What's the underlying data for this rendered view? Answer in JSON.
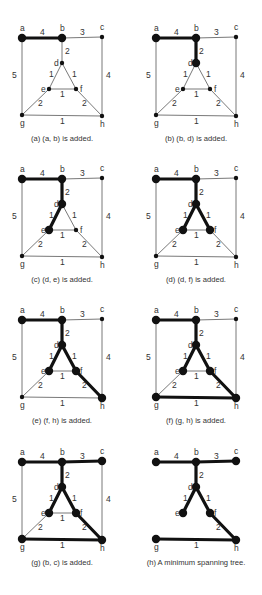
{
  "graph": {
    "nodes": {
      "a": [
        0,
        0
      ],
      "b": [
        40,
        0
      ],
      "c": [
        80,
        -1
      ],
      "d": [
        40,
        25
      ],
      "e": [
        27,
        51
      ],
      "f": [
        54,
        51
      ],
      "g": [
        0,
        77
      ],
      "h": [
        80,
        78
      ]
    },
    "node_label_offsets": {
      "a": [
        -2,
        -7
      ],
      "b": [
        -2,
        -7
      ],
      "c": [
        -2,
        -7
      ],
      "d": [
        -8,
        3
      ],
      "e": [
        -8,
        3
      ],
      "f": [
        4,
        3
      ],
      "g": [
        -2,
        11
      ],
      "h": [
        -2,
        11
      ]
    },
    "edges": [
      {
        "u": "a",
        "v": "b",
        "w": "4",
        "lx": 18,
        "ly": -3
      },
      {
        "u": "b",
        "v": "c",
        "w": "3",
        "lx": 58,
        "ly": -3
      },
      {
        "u": "b",
        "v": "d",
        "w": "2",
        "lx": 43,
        "ly": 16
      },
      {
        "u": "a",
        "v": "g",
        "w": "5",
        "lx": -10,
        "ly": 40
      },
      {
        "u": "c",
        "v": "h",
        "w": "4",
        "lx": 84,
        "ly": 40
      },
      {
        "u": "d",
        "v": "e",
        "w": "1",
        "lx": 27,
        "ly": 39
      },
      {
        "u": "d",
        "v": "f",
        "w": "1",
        "lx": 50,
        "ly": 39
      },
      {
        "u": "e",
        "v": "f",
        "w": "1",
        "lx": 38,
        "ly": 59
      },
      {
        "u": "e",
        "v": "g",
        "w": "2",
        "lx": 16,
        "ly": 68
      },
      {
        "u": "f",
        "v": "h",
        "w": "2",
        "lx": 60,
        "ly": 68
      },
      {
        "u": "g",
        "v": "h",
        "w": "1",
        "lx": 38,
        "ly": 86
      }
    ]
  },
  "panels": [
    {
      "id": "a",
      "ox": 22,
      "oy": 38,
      "caption": "(a) (a, b) is added.",
      "tree_edges": [
        "a-b"
      ],
      "show_non_tree": true
    },
    {
      "id": "b",
      "ox": 156,
      "oy": 38,
      "caption": "(b) (b, d) is added.",
      "tree_edges": [
        "a-b",
        "b-d"
      ],
      "show_non_tree": true
    },
    {
      "id": "c",
      "ox": 22,
      "oy": 179,
      "caption": "(c) (d, e) is added.",
      "tree_edges": [
        "a-b",
        "b-d",
        "d-e"
      ],
      "show_non_tree": true
    },
    {
      "id": "d",
      "ox": 156,
      "oy": 179,
      "caption": "(d) (d, f) is added.",
      "tree_edges": [
        "a-b",
        "b-d",
        "d-e",
        "d-f"
      ],
      "show_non_tree": true
    },
    {
      "id": "e",
      "ox": 22,
      "oy": 320,
      "caption": "(e) (f, h) is added.",
      "tree_edges": [
        "a-b",
        "b-d",
        "d-e",
        "d-f",
        "f-h"
      ],
      "show_non_tree": true
    },
    {
      "id": "f",
      "ox": 156,
      "oy": 320,
      "caption": "(f) (g, h) is added.",
      "tree_edges": [
        "a-b",
        "b-d",
        "d-e",
        "d-f",
        "f-h",
        "g-h"
      ],
      "show_non_tree": true
    },
    {
      "id": "g",
      "ox": 22,
      "oy": 462,
      "caption": "(g) (b, c) is added.",
      "tree_edges": [
        "a-b",
        "b-d",
        "d-e",
        "d-f",
        "f-h",
        "g-h",
        "b-c"
      ],
      "show_non_tree": true
    },
    {
      "id": "h",
      "ox": 156,
      "oy": 462,
      "caption": "(h) A minimum spanning tree.",
      "tree_edges": [
        "a-b",
        "b-d",
        "d-e",
        "d-f",
        "f-h",
        "g-h",
        "b-c"
      ],
      "show_non_tree": false
    }
  ],
  "captions": {
    "a": "(a) (a, b) is added.",
    "b": "(b) (b, d) is added.",
    "c": "(c) (d, e) is added.",
    "d": "(d) (d, f) is added.",
    "e": "(e) (f, h) is added.",
    "f": "(f) (g, h) is added.",
    "g": "(g) (b, c) is added.",
    "h": "(h) A minimum spanning tree."
  },
  "colors": {
    "thin_edge": "#555555",
    "tree_edge": "#111111",
    "text": "#333333",
    "background": "#ffffff"
  }
}
